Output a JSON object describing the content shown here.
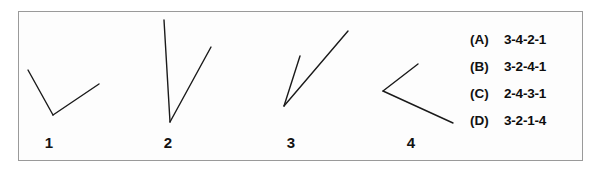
{
  "figure": {
    "border_color": "#9a9a9a",
    "background_color": "#fdfdfd",
    "stroke_color": "#1a1a1a"
  },
  "angles": [
    {
      "label": "1",
      "vertex": [
        53,
        115
      ],
      "arm_a_end": [
        28,
        70
      ],
      "arm_b_end": [
        99,
        84
      ]
    },
    {
      "label": "2",
      "vertex": [
        170,
        122
      ],
      "arm_a_end": [
        164,
        20
      ],
      "arm_b_end": [
        211,
        47
      ]
    },
    {
      "label": "3",
      "vertex": [
        284,
        106
      ],
      "arm_a_end": [
        300,
        56
      ],
      "arm_b_end": [
        348,
        31
      ]
    },
    {
      "label": "4",
      "vertex": [
        383,
        91
      ],
      "arm_a_end": [
        418,
        64
      ],
      "arm_b_end": [
        453,
        123
      ]
    }
  ],
  "options": [
    {
      "key": "(A)",
      "value": "3-4-2-1"
    },
    {
      "key": "(B)",
      "value": "3-2-4-1"
    },
    {
      "key": "(C)",
      "value": "2-4-3-1"
    },
    {
      "key": "(D)",
      "value": "3-2-1-4"
    }
  ]
}
